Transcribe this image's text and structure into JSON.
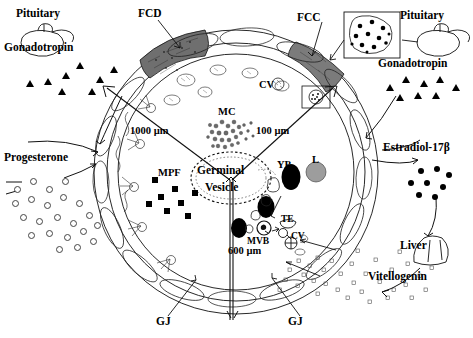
{
  "figure": {
    "type": "diagram"
  },
  "left_panel": {
    "pituitary_label": "Pituitary",
    "gonadotropin_label": "Gonadotropin",
    "progesterone_label": "Progesterone",
    "gonadotropin_marker": "triangle",
    "progesterone_marker": "open-circle",
    "gonadotropin_count": 8,
    "progesterone_count": 22
  },
  "right_panel": {
    "pituitary_label": "Pituitary",
    "gonadotropin_label": "Gonadotropin",
    "estradiol_label": "Estradiol-17β",
    "liver_label": "Liver",
    "vitellogenin_label": "Vitellogenin",
    "gonadotropin_marker": "triangle",
    "estradiol_marker": "filled-circle",
    "vitellogenin_marker": "open-square",
    "gonadotropin_count": 8,
    "estradiol_count": 8,
    "vitellogenin_count": 34
  },
  "follicle_labels": {
    "fcd": "FCD",
    "fcc": "FCC",
    "gj_left": "GJ",
    "gj_right": "GJ"
  },
  "oocyte_labels": {
    "mc": "MC",
    "cv_top": "CV",
    "cv_lower": "CV",
    "germinal": "Germinal",
    "vesicle": "Vesicle",
    "mpf": "MPF",
    "yp": "YP",
    "l": "L",
    "mvb": "MVB",
    "te": "TE"
  },
  "scale_bars": {
    "upper_left": "1000 µm",
    "upper_right": "100 µm",
    "lower": "600 µm"
  },
  "colors": {
    "ink": "#000000",
    "fcd_fill": "#6b6b6b",
    "fcc_fill": "#7a7a7a",
    "lipid_fill": "#9a9a9a",
    "yolk_fill": "#000000",
    "membrane": "#222222"
  },
  "insets": {
    "top_right_box": "gonadotropin-receptor-inset",
    "mid_box": "cortical-vesicle-inset"
  }
}
